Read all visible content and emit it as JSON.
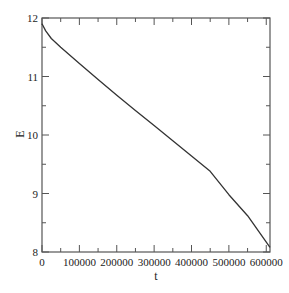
{
  "chart_data": {
    "type": "line",
    "title": "",
    "xlabel": "t",
    "ylabel": "E",
    "xlim": [
      0,
      610000
    ],
    "ylim": [
      8,
      12
    ],
    "x_ticks": [
      0,
      100000,
      200000,
      300000,
      400000,
      500000,
      600000
    ],
    "x_tick_labels": [
      "0",
      "100000",
      "200000",
      "300000",
      "400000",
      "500000",
      "600000"
    ],
    "y_ticks": [
      8,
      9,
      10,
      11,
      12
    ],
    "y_tick_labels": [
      "8",
      "9",
      "10",
      "11",
      "12"
    ],
    "grid": false,
    "legend": null,
    "series": [
      {
        "name": "E(t)",
        "color": "#333333",
        "x": [
          0,
          10000,
          25000,
          50000,
          100000,
          150000,
          200000,
          250000,
          300000,
          350000,
          400000,
          450000,
          500000,
          550000,
          610000
        ],
        "y": [
          11.9,
          11.78,
          11.65,
          11.5,
          11.22,
          10.95,
          10.68,
          10.42,
          10.16,
          9.9,
          9.64,
          9.38,
          8.98,
          8.62,
          8.08
        ]
      }
    ]
  }
}
